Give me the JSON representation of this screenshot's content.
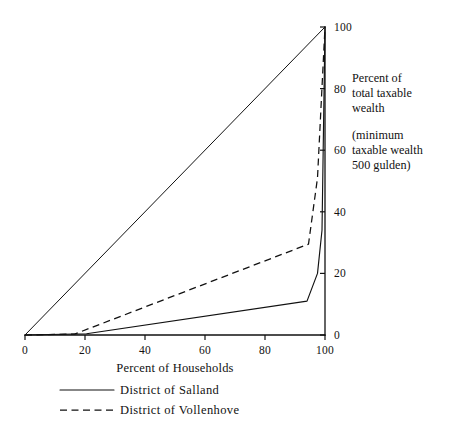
{
  "chart_data": {
    "type": "line",
    "title": "",
    "subtitle": "",
    "xlabel": "Percent of Households",
    "ylabel": "Percent of total taxable wealth",
    "ylabel_lines": [
      "Percent of",
      "total taxable",
      "wealth"
    ],
    "ynote_lines": [
      "(minimum",
      "taxable wealth",
      "500 gulden)"
    ],
    "xlim": [
      0,
      100
    ],
    "ylim": [
      0,
      100
    ],
    "xticks": [
      0,
      20,
      40,
      60,
      80,
      100
    ],
    "yticks": [
      0,
      20,
      40,
      60,
      80,
      100
    ],
    "xtick_labels": [
      "0",
      "20",
      "40",
      "60",
      "80",
      "100"
    ],
    "ytick_labels": [
      "0",
      "20",
      "40",
      "60",
      "80",
      "100"
    ],
    "grid": false,
    "legend_position": "below",
    "series": [
      {
        "name": "Line of perfect equality",
        "style": "solid",
        "show_in_legend": false,
        "x": [
          0,
          100
        ],
        "y": [
          0,
          100
        ]
      },
      {
        "name": "District of Salland",
        "style": "solid",
        "show_in_legend": true,
        "x": [
          0,
          20.5,
          94.0,
          97.5,
          99.0,
          100
        ],
        "y": [
          0,
          0.4,
          11.0,
          20.0,
          34.0,
          100
        ]
      },
      {
        "name": "District of Vollenhove",
        "style": "dashed",
        "show_in_legend": true,
        "x": [
          0,
          16.5,
          94.5,
          97.5,
          100
        ],
        "y": [
          0,
          0.3,
          29.5,
          51.0,
          100
        ]
      }
    ]
  },
  "legend": {
    "items": [
      {
        "label": "District of Salland",
        "style": "solid"
      },
      {
        "label": "District of Vollenhove",
        "style": "dashed"
      }
    ]
  },
  "axes": {
    "x_title": "Percent of Households",
    "y_note_block_1": "Percent of",
    "y_note_block_2": "total taxable",
    "y_note_block_3": "wealth",
    "y_note_block_4": "(minimum",
    "y_note_block_5": "taxable wealth",
    "y_note_block_6": "500 gulden)"
  },
  "colors": {
    "ink": "#111111",
    "background": "#ffffff"
  }
}
